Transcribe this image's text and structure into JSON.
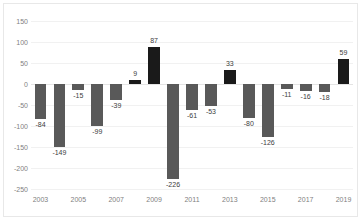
{
  "chart_data": {
    "type": "bar",
    "title": "",
    "xlabel": "",
    "ylabel": "",
    "categories": [
      "2003",
      "2004",
      "2005",
      "2006",
      "2007",
      "2008",
      "2009",
      "2010",
      "2011",
      "2012",
      "2013",
      "2014",
      "2015",
      "2016",
      "2017",
      "2018",
      "2019"
    ],
    "values": [
      -84,
      -149,
      -15,
      -99,
      -39,
      9,
      87,
      -226,
      -61,
      -53,
      33,
      -80,
      -126,
      -11,
      -16,
      -18,
      59
    ],
    "data_labels": [
      "-84",
      "-149",
      "-15",
      "-99",
      "-39",
      "9",
      "87",
      "-226",
      "-61",
      "-53",
      "33",
      "-80",
      "-126",
      "-11",
      "-16",
      "-18",
      "59"
    ],
    "ylim": [
      -250,
      150
    ],
    "yticks": [
      150,
      100,
      50,
      0,
      -50,
      -100,
      -150,
      -200,
      -250
    ],
    "ytick_labels": [
      "150",
      "100",
      "50",
      "0",
      "-50",
      "-100",
      "-150",
      "-200",
      "-250"
    ],
    "xtick_labels": [
      "2003",
      "2005",
      "2007",
      "2009",
      "2011",
      "2013",
      "2015",
      "2017",
      "2019"
    ],
    "xtick_indices": [
      0,
      2,
      4,
      6,
      8,
      10,
      12,
      14,
      16
    ],
    "grid": true,
    "legend": "none",
    "colors": {
      "negative_bar": "#595959",
      "positive_bar": "#1a1a1a",
      "gridline": "#f1f1f1",
      "axis_text": "#7f7f7f",
      "label_text": "#404040",
      "background": "#ffffff",
      "frame": "#e8e8e8"
    }
  }
}
